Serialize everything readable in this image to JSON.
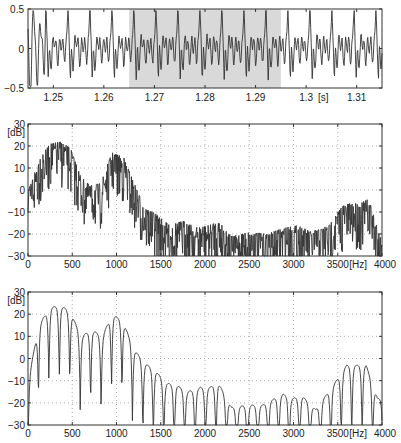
{
  "chart_data": [
    {
      "type": "line",
      "title": "",
      "xlabel": "[s]",
      "ylabel": "",
      "xlim": [
        1.245,
        1.315
      ],
      "ylim": [
        -0.5,
        0.5
      ],
      "xticks": [
        "1.25",
        "1.26",
        "1.27",
        "1.28",
        "1.29",
        "1.3",
        "1.31"
      ],
      "yticks": [
        "0.5",
        "0",
        "-0.5"
      ],
      "grid": false,
      "highlight_region": {
        "x_start": 1.265,
        "x_end": 1.295,
        "color": "#d9d9d9"
      },
      "series": [
        {
          "name": "waveform",
          "description": "periodic voiced speech signal, peaks ~+0.45, troughs ~-0.45, period ~5 ms"
        }
      ]
    },
    {
      "type": "line",
      "title": "",
      "xlabel": "[Hz]",
      "ylabel": "[dB]",
      "xlim": [
        0,
        4000
      ],
      "ylim": [
        -30,
        30
      ],
      "xticks": [
        "0",
        "500",
        "1000",
        "1500",
        "2000",
        "2500",
        "3000",
        "3500",
        "4000"
      ],
      "yticks": [
        "30",
        "20",
        "10",
        "0",
        "-10",
        "-20",
        "-30"
      ],
      "grid": true,
      "series": [
        {
          "name": "spectrum_raw",
          "x": [
            0,
            120,
            250,
            370,
            480,
            600,
            700,
            820,
            950,
            1080,
            1200,
            1320,
            1450,
            1600,
            1750,
            1900,
            2050,
            2150,
            2300,
            2500,
            2700,
            2900,
            3050,
            3200,
            3400,
            3550,
            3650,
            3750,
            3850,
            3950,
            4000
          ],
          "values": [
            0,
            15,
            22,
            23,
            20,
            7,
            3,
            4,
            18,
            16,
            4,
            -7,
            -10,
            -15,
            -13,
            -16,
            -15,
            -13,
            -20,
            -18,
            -19,
            -16,
            -15,
            -18,
            -15,
            -6,
            -5,
            -5,
            -3,
            -16,
            -22
          ]
        }
      ]
    },
    {
      "type": "line",
      "title": "",
      "xlabel": "[Hz]",
      "ylabel": "[dB]",
      "xlim": [
        0,
        4000
      ],
      "ylim": [
        -30,
        30
      ],
      "xticks": [
        "0",
        "500",
        "1000",
        "1500",
        "2000",
        "2500",
        "3000",
        "3500",
        "4000"
      ],
      "yticks": [
        "30",
        "20",
        "10",
        "0",
        "-10",
        "-20",
        "-30"
      ],
      "grid": true,
      "series": [
        {
          "name": "spectrum_smoothed",
          "x": [
            0,
            120,
            250,
            370,
            480,
            600,
            720,
            840,
            950,
            1070,
            1200,
            1320,
            1450,
            1560,
            1680,
            1800,
            1950,
            2050,
            2150,
            2300,
            2500,
            2650,
            2880,
            2980,
            3100,
            3250,
            3450,
            3600,
            3700,
            3820,
            3950
          ],
          "values": [
            -13,
            13,
            21,
            22,
            19,
            8,
            11,
            8,
            18,
            15,
            2,
            -4,
            -8,
            -13,
            -14,
            -17,
            -15,
            -15,
            -13,
            -24,
            -23,
            -23,
            -18,
            -20,
            -19,
            -25,
            -14,
            -5,
            -5,
            -5,
            -20
          ]
        }
      ]
    }
  ],
  "labels": {
    "top_xunit": "[s]",
    "spec_xunit": "[Hz]",
    "spec_yunit": "[dB]"
  }
}
